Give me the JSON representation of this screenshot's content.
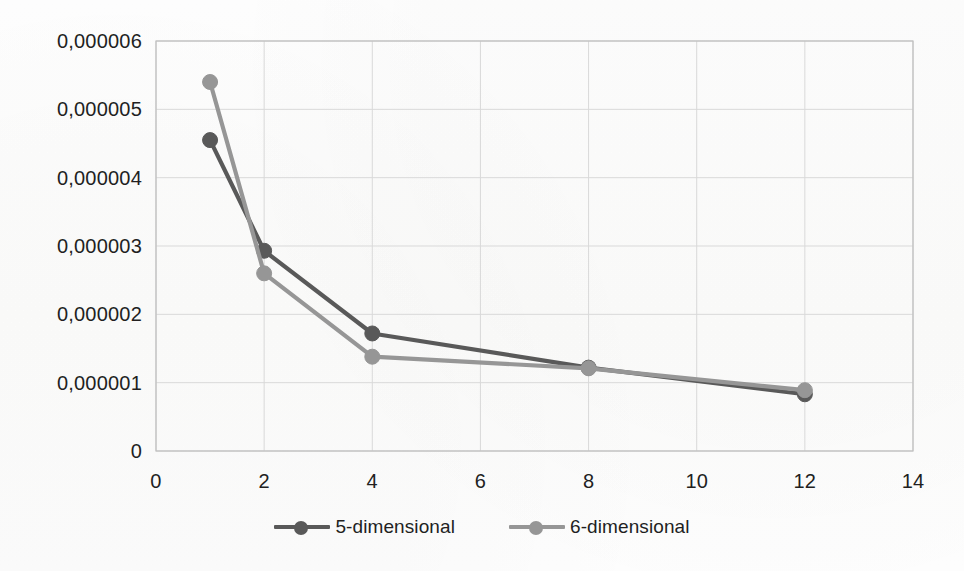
{
  "chart_data": {
    "type": "line",
    "title": "",
    "subtitle": "",
    "xlabel": "",
    "ylabel": "",
    "xlim": [
      0,
      14
    ],
    "ylim": [
      0,
      6e-06
    ],
    "grid": true,
    "legend_position": "bottom",
    "decimal_separator": ",",
    "x": [
      1,
      2,
      4,
      8,
      12
    ],
    "series": [
      {
        "name": "5-dimensional",
        "color": "#595959",
        "values": [
          4.55e-06,
          2.93e-06,
          1.72e-06,
          1.22e-06,
          8.3e-07
        ]
      },
      {
        "name": "6-dimensional",
        "color": "#969696",
        "values": [
          5.4e-06,
          2.6e-06,
          1.38e-06,
          1.21e-06,
          8.9e-07
        ]
      }
    ],
    "y_ticks": [
      0,
      1e-06,
      2e-06,
      3e-06,
      4e-06,
      5e-06,
      6e-06
    ],
    "y_tick_labels": [
      "0",
      "0,000001",
      "0,000002",
      "0,000003",
      "0,000004",
      "0,000005",
      "0,000006"
    ],
    "x_ticks": [
      0,
      2,
      4,
      6,
      8,
      10,
      12,
      14
    ],
    "x_tick_labels": [
      "0",
      "2",
      "4",
      "6",
      "8",
      "10",
      "12",
      "14"
    ]
  },
  "legend": {
    "items": [
      {
        "label": "5-dimensional",
        "color": "#595959"
      },
      {
        "label": "6-dimensional",
        "color": "#969696"
      }
    ]
  },
  "colors": {
    "series_5d": "#595959",
    "series_6d": "#969696",
    "grid": "#d9d9d9",
    "axis": "#bfbfbf",
    "text": "#221f1f",
    "background": "#fdfdfc"
  }
}
